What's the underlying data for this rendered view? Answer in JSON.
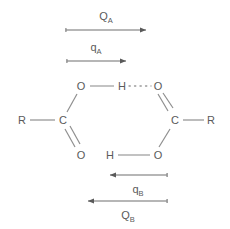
{
  "figure": {
    "background_color": "#ffffff",
    "stroke_color": "#7a7a7a",
    "text_color": "#5a5a5a"
  },
  "arrows": {
    "top_outer": {
      "label_main": "Q",
      "label_sub": "A",
      "direction": "right",
      "x1": 66,
      "x2": 146,
      "y": 30,
      "label_x": 106,
      "label_y": 16
    },
    "top_inner": {
      "label_main": "q",
      "label_sub": "A",
      "direction": "right",
      "x1": 67,
      "x2": 126,
      "y": 61,
      "label_x": 96,
      "label_y": 47
    },
    "bottom_inner": {
      "label_main": "q",
      "label_sub": "B",
      "direction": "left",
      "x1": 167,
      "x2": 110,
      "y": 175,
      "label_x": 138,
      "label_y": 189
    },
    "bottom_outer": {
      "label_main": "Q",
      "label_sub": "B",
      "direction": "left",
      "x1": 167,
      "x2": 88,
      "y": 201,
      "label_x": 128,
      "label_y": 215
    }
  },
  "molecule": {
    "atoms": [
      {
        "name": "left-r-group",
        "label": "R",
        "x": 22,
        "y": 120
      },
      {
        "name": "left-carbon",
        "label": "C",
        "x": 63,
        "y": 120
      },
      {
        "name": "left-hydroxyl-oxygen",
        "label": "O",
        "x": 81,
        "y": 86
      },
      {
        "name": "left-carbonyl-oxygen",
        "label": "O",
        "x": 81,
        "y": 155
      },
      {
        "name": "bridging-hydrogen-top",
        "label": "H",
        "x": 122,
        "y": 86
      },
      {
        "name": "bridging-hydrogen-bottom",
        "label": "H",
        "x": 110,
        "y": 155
      },
      {
        "name": "right-carbonyl-oxygen",
        "label": "O",
        "x": 158,
        "y": 86
      },
      {
        "name": "right-hydroxyl-oxygen",
        "label": "O",
        "x": 158,
        "y": 155
      },
      {
        "name": "right-carbon",
        "label": "C",
        "x": 175,
        "y": 120
      },
      {
        "name": "right-r-group",
        "label": "R",
        "x": 211,
        "y": 120
      }
    ],
    "bond_labels": {
      "covalent": "single bond",
      "double": "double bond",
      "hydrogen": "hydrogen bond (dotted)"
    }
  }
}
